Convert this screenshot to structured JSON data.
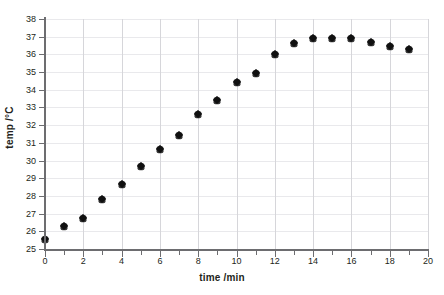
{
  "chart_data": {
    "type": "scatter",
    "title": "",
    "xlabel": "time /min",
    "ylabel": "temp /°C",
    "xlim": [
      0,
      20
    ],
    "ylim": [
      25,
      38
    ],
    "xticks": [
      0,
      1,
      2,
      3,
      4,
      5,
      6,
      7,
      8,
      9,
      10,
      11,
      12,
      13,
      14,
      15,
      16,
      17,
      18,
      19,
      20
    ],
    "xtick_labels": [
      "0",
      "",
      "2",
      "",
      "4",
      "",
      "6",
      "",
      "8",
      "",
      "10",
      "",
      "12",
      "",
      "14",
      "",
      "16",
      "",
      "18",
      "",
      "20"
    ],
    "yticks": [
      25,
      26,
      27,
      28,
      29,
      30,
      31,
      32,
      33,
      34,
      35,
      36,
      37,
      38
    ],
    "ytick_labels": [
      "25",
      "26",
      "27",
      "28",
      "29",
      "30",
      "31",
      "32",
      "33",
      "34",
      "35",
      "36",
      "37",
      "38"
    ],
    "grid": true,
    "legend": false,
    "marker": "diamond",
    "marker_color": "#111111",
    "x": [
      0,
      1,
      2,
      3,
      4,
      5,
      6,
      7,
      8,
      9,
      10,
      11,
      12,
      13,
      14,
      15,
      16,
      17,
      18,
      19
    ],
    "values": [
      25.55,
      26.3,
      26.75,
      27.8,
      28.65,
      29.7,
      30.65,
      31.45,
      32.65,
      33.45,
      34.45,
      34.95,
      36.0,
      36.65,
      36.95,
      36.95,
      36.95,
      36.7,
      36.5,
      36.3
    ],
    "series": [
      {
        "name": "temperature",
        "values": [
          25.55,
          26.3,
          26.75,
          27.8,
          28.65,
          29.7,
          30.65,
          31.45,
          32.65,
          33.45,
          34.45,
          34.95,
          36.0,
          36.65,
          36.95,
          36.95,
          36.95,
          36.7,
          36.5,
          36.3
        ]
      }
    ]
  },
  "axes": {
    "x_title": "time /min",
    "y_title": "temp /°C"
  },
  "colors": {
    "marker": "#111111",
    "axis": "#6d6d70",
    "grid_major": "#d6d6da",
    "grid_minor": "#e9e9ec",
    "background": "#ffffff",
    "text": "#231f20"
  }
}
